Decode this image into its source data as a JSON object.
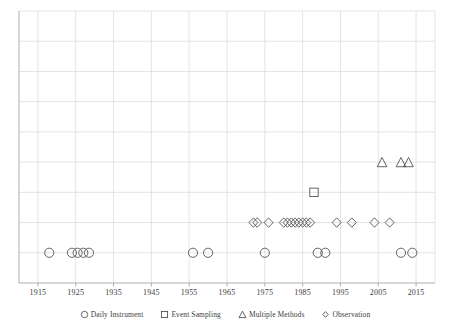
{
  "chart_data": {
    "type": "scatter",
    "title": "",
    "xlabel": "",
    "ylabel": "",
    "xlim": [
      1910,
      2020
    ],
    "ylim": [
      0,
      9
    ],
    "grid": true,
    "y_tick_labels": [],
    "x_tick_labels": [
      "1915",
      "1925",
      "1935",
      "1945",
      "1955",
      "1965",
      "1975",
      "1985",
      "1995",
      "2005",
      "2015"
    ],
    "x_ticks": [
      1915,
      1925,
      1935,
      1945,
      1955,
      1965,
      1975,
      1985,
      1995,
      2005,
      2015
    ],
    "legend_position": "bottom",
    "series": [
      {
        "name": "Daily Instrument",
        "marker": "circle",
        "color": "#4a4a4a",
        "y": 1,
        "x": [
          1918,
          1924,
          1925.5,
          1927,
          1928.5,
          1956,
          1960,
          1975,
          1989,
          1991,
          2011,
          2014
        ],
        "points": [
          {
            "x": 1918,
            "y": 1
          },
          {
            "x": 1924,
            "y": 1
          },
          {
            "x": 1925.5,
            "y": 1
          },
          {
            "x": 1927,
            "y": 1
          },
          {
            "x": 1928.5,
            "y": 1
          },
          {
            "x": 1956,
            "y": 1
          },
          {
            "x": 1960,
            "y": 1
          },
          {
            "x": 1975,
            "y": 1
          },
          {
            "x": 1989,
            "y": 1
          },
          {
            "x": 1991,
            "y": 1
          },
          {
            "x": 2011,
            "y": 1
          },
          {
            "x": 2014,
            "y": 1
          }
        ]
      },
      {
        "name": "Event Sampling",
        "marker": "square",
        "color": "#4a4a4a",
        "y": 3,
        "x": [
          1988
        ],
        "points": [
          {
            "x": 1988,
            "y": 3
          }
        ]
      },
      {
        "name": "Multiple Methods",
        "marker": "triangle",
        "color": "#4a4a4a",
        "y": 4,
        "x": [
          2006,
          2011,
          2013
        ],
        "points": [
          {
            "x": 2006,
            "y": 4
          },
          {
            "x": 2011,
            "y": 4
          },
          {
            "x": 2013,
            "y": 4
          }
        ]
      },
      {
        "name": "Observation",
        "marker": "diamond",
        "color": "#4a4a4a",
        "y": 2,
        "x": [
          1972,
          1973,
          1976,
          1980,
          1981,
          1982,
          1983,
          1984,
          1985,
          1986,
          1987,
          1994,
          1998,
          2004,
          2008
        ],
        "points": [
          {
            "x": 1972,
            "y": 2
          },
          {
            "x": 1973,
            "y": 2
          },
          {
            "x": 1976,
            "y": 2
          },
          {
            "x": 1980,
            "y": 2
          },
          {
            "x": 1981,
            "y": 2
          },
          {
            "x": 1982,
            "y": 2
          },
          {
            "x": 1983,
            "y": 2
          },
          {
            "x": 1984,
            "y": 2
          },
          {
            "x": 1985,
            "y": 2
          },
          {
            "x": 1986,
            "y": 2
          },
          {
            "x": 1987,
            "y": 2
          },
          {
            "x": 1994,
            "y": 2
          },
          {
            "x": 1998,
            "y": 2
          },
          {
            "x": 2004,
            "y": 2
          },
          {
            "x": 2008,
            "y": 2
          }
        ]
      }
    ]
  },
  "legend": {
    "items": [
      {
        "label": "Daily Instrument",
        "marker": "circle"
      },
      {
        "label": "Event Sampling",
        "marker": "square"
      },
      {
        "label": "Multiple Methods",
        "marker": "triangle"
      },
      {
        "label": "Observation",
        "marker": "diamond"
      }
    ]
  },
  "axis": {
    "x_labels": [
      "1915",
      "1925",
      "1935",
      "1945",
      "1955",
      "1965",
      "1975",
      "1985",
      "1995",
      "2005",
      "2015"
    ]
  },
  "colors": {
    "grid": "#d9d9d9",
    "axis": "#a6a6a6",
    "marker_stroke": "#4a4a4a",
    "text": "#3d3d3d"
  }
}
